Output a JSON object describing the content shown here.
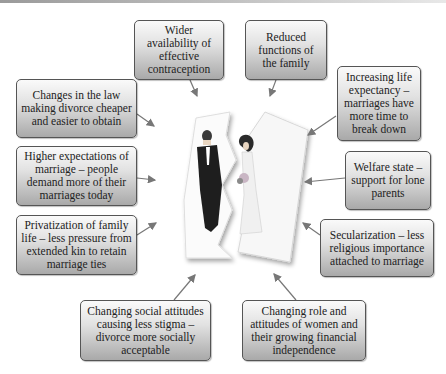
{
  "diagram": {
    "center": {
      "description": "Torn wedding photo of bride and groom",
      "icon": "torn-wedding-photo-icon"
    },
    "boxes": [
      {
        "id": "contraception",
        "text": "Wider availability of effective contraception"
      },
      {
        "id": "functions",
        "text": "Reduced functions of the family"
      },
      {
        "id": "law",
        "text": "Changes in the law making divorce cheaper and easier to obtain"
      },
      {
        "id": "life-expectancy",
        "text": "Increasing life expectancy – marriages have more time to break down"
      },
      {
        "id": "expectations",
        "text": "Higher expectations of marriage – people demand more of their marriages today"
      },
      {
        "id": "welfare",
        "text": "Welfare state – support for lone parents"
      },
      {
        "id": "privatization",
        "text": "Privatization of family life – less pressure from extended kin to retain marriage ties"
      },
      {
        "id": "secularization",
        "text": "Secularization – less religious importance attached to marriage"
      },
      {
        "id": "social-attitudes",
        "text": "Changing social attitudes causing less stigma – divorce more socially acceptable"
      },
      {
        "id": "women",
        "text": "Changing role and attitudes of women and their growing financial independence"
      }
    ],
    "colors": {
      "box_border": "#555555",
      "box_top": "#fafafa",
      "box_bottom": "#a9a9a9",
      "arrow": "#777777",
      "text": "#222222"
    }
  }
}
